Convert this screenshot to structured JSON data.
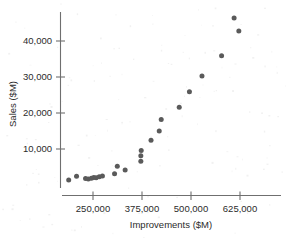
{
  "chart_data": {
    "type": "scatter",
    "title": "",
    "xlabel": "Improvements ($M)",
    "ylabel": "Sales ($M)",
    "xlim": [
      170000,
      720000
    ],
    "ylim": [
      0,
      48000
    ],
    "xticks": [
      250000,
      375000,
      500000,
      625000
    ],
    "xtick_labels": [
      "250,000",
      "375,000",
      "500,000",
      "625,000"
    ],
    "yticks": [
      10000,
      20000,
      30000,
      40000
    ],
    "ytick_labels": [
      "10,000",
      "20,000",
      "30,000",
      "40,000"
    ],
    "grid": false,
    "legend": null,
    "marker_color": "#5a5a5a",
    "axis_color": "#6f6f6f",
    "points": [
      {
        "x": 188000,
        "y": 1400
      },
      {
        "x": 208000,
        "y": 2400
      },
      {
        "x": 231000,
        "y": 1800
      },
      {
        "x": 238000,
        "y": 1700
      },
      {
        "x": 246000,
        "y": 1900
      },
      {
        "x": 252000,
        "y": 2100
      },
      {
        "x": 258000,
        "y": 2000
      },
      {
        "x": 266000,
        "y": 2300
      },
      {
        "x": 274000,
        "y": 2500
      },
      {
        "x": 305000,
        "y": 3100
      },
      {
        "x": 312000,
        "y": 5200
      },
      {
        "x": 332000,
        "y": 4200
      },
      {
        "x": 372000,
        "y": 6600
      },
      {
        "x": 372000,
        "y": 8100
      },
      {
        "x": 373000,
        "y": 9600
      },
      {
        "x": 398000,
        "y": 12400
      },
      {
        "x": 419000,
        "y": 15000
      },
      {
        "x": 424000,
        "y": 18200
      },
      {
        "x": 470000,
        "y": 21600
      },
      {
        "x": 496000,
        "y": 25900
      },
      {
        "x": 528000,
        "y": 30300
      },
      {
        "x": 578000,
        "y": 35900
      },
      {
        "x": 622000,
        "y": 42800
      },
      {
        "x": 610000,
        "y": 46400
      }
    ]
  },
  "axes": {
    "x_axis_name": "improvements-axis",
    "y_axis_name": "sales-axis"
  }
}
